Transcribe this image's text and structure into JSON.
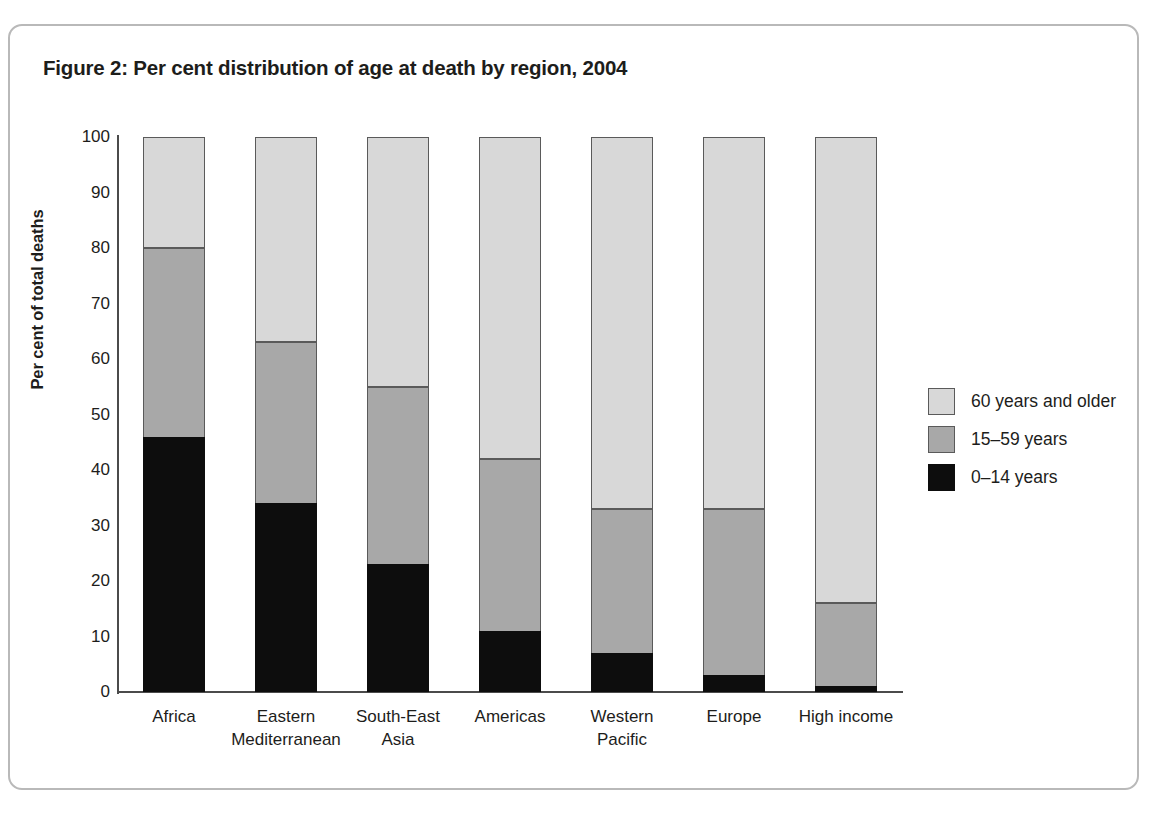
{
  "figure": {
    "title": "Figure 2: Per cent distribution of age at death by region, 2004"
  },
  "chart_data": {
    "type": "bar",
    "stacked": true,
    "title": "Figure 2: Per cent distribution of age at death by region, 2004",
    "xlabel": "",
    "ylabel": "Per cent of total deaths",
    "ylim": [
      0,
      100
    ],
    "ytick_labels": [
      "0",
      "10",
      "20",
      "30",
      "40",
      "50",
      "60",
      "70",
      "80",
      "90",
      "100"
    ],
    "yticks": [
      0,
      10,
      20,
      30,
      40,
      50,
      60,
      70,
      80,
      90,
      100
    ],
    "grid": false,
    "legend_position": "right",
    "categories": [
      "Africa",
      "Eastern Mediterranean",
      "South-East Asia",
      "Americas",
      "Western Pacific",
      "Europe",
      "High income"
    ],
    "category_lines": [
      [
        "Africa"
      ],
      [
        "Eastern",
        "Mediterranean"
      ],
      [
        "South-East",
        "Asia"
      ],
      [
        "Americas"
      ],
      [
        "Western",
        "Pacific"
      ],
      [
        "Europe"
      ],
      [
        "High income"
      ]
    ],
    "series": [
      {
        "name": "0–14 years",
        "color": "#0d0d0d",
        "values": [
          46,
          34,
          23,
          11,
          7,
          3,
          1
        ]
      },
      {
        "name": "15–59 years",
        "color": "#a8a8a8",
        "values": [
          34,
          29,
          32,
          31,
          26,
          30,
          15
        ]
      },
      {
        "name": "60 years and older",
        "color": "#d8d8d8",
        "values": [
          20,
          37,
          45,
          58,
          67,
          67,
          84
        ]
      }
    ],
    "cumulative_tops": {
      "young": [
        46,
        34,
        23,
        11,
        7,
        3,
        1
      ],
      "young_plus_mid": [
        80,
        63,
        55,
        42,
        33,
        33,
        16
      ],
      "total": [
        100,
        100,
        100,
        100,
        100,
        100,
        100
      ]
    },
    "legend": [
      {
        "label": "60 years and older",
        "color": "#d8d8d8",
        "swatch": "sw-old"
      },
      {
        "label": "15–59 years",
        "color": "#a8a8a8",
        "swatch": "sw-mid"
      },
      {
        "label": "0–14 years",
        "color": "#0d0d0d",
        "swatch": "sw-young"
      }
    ]
  }
}
